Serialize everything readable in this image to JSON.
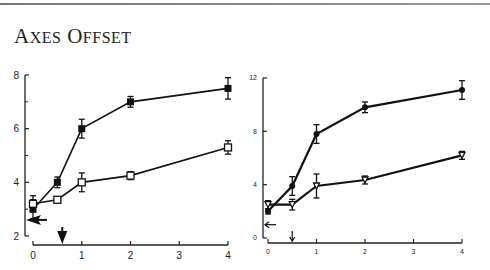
{
  "title": {
    "first_cap": "A",
    "first_rest": "XES",
    "second_cap": "O",
    "second_rest": "FFSET",
    "full": "Axes Offset"
  },
  "chart_data": [
    {
      "type": "line",
      "title": "",
      "xlabel": "",
      "ylabel": "",
      "xlim": [
        0,
        4
      ],
      "ylim": [
        2,
        8
      ],
      "xticks": [
        "0",
        "1",
        "2",
        "3",
        "4"
      ],
      "yticks": [
        "2",
        "4",
        "6",
        "8"
      ],
      "minor_yticks": [
        3,
        5,
        7
      ],
      "grid": false,
      "legend": null,
      "annotations": [
        {
          "type": "arrow-left",
          "at_y": 2.6,
          "note": "arrow pointing left at y-axis"
        },
        {
          "type": "arrow-down",
          "at_x": 0.6,
          "note": "arrow pointing down at x-axis"
        }
      ],
      "x": [
        0,
        0.5,
        1,
        2,
        4
      ],
      "series": [
        {
          "name": "filled squares",
          "marker": "square-filled",
          "values": [
            3.0,
            4.0,
            6.0,
            7.0,
            7.5
          ],
          "errors": [
            0.35,
            0.2,
            0.35,
            0.2,
            0.4
          ]
        },
        {
          "name": "open squares",
          "marker": "square-open",
          "values": [
            3.2,
            3.35,
            4.0,
            4.25,
            5.3
          ],
          "errors": [
            0.3,
            0.1,
            0.35,
            0.15,
            0.25
          ]
        }
      ]
    },
    {
      "type": "line",
      "title": "",
      "xlabel": "",
      "ylabel": "",
      "xlim": [
        0,
        4
      ],
      "ylim": [
        0,
        12
      ],
      "xticks": [
        "0",
        "1",
        "2",
        "3",
        "4"
      ],
      "yticks": [
        "0",
        "4",
        "8",
        "12"
      ],
      "grid": false,
      "legend": null,
      "annotations": [
        {
          "type": "arrow-left",
          "at_y": 1.0,
          "note": "arrow pointing left at y-axis"
        },
        {
          "type": "arrow-down",
          "at_x": 0.5,
          "note": "small arrow pointing down at x-axis"
        }
      ],
      "x": [
        0,
        0.5,
        1,
        2,
        4
      ],
      "series": [
        {
          "name": "filled circles",
          "marker": "circle-filled",
          "values": [
            2.0,
            3.9,
            7.8,
            9.8,
            11.1
          ],
          "errors": [
            0.2,
            0.7,
            0.7,
            0.4,
            0.7
          ]
        },
        {
          "name": "open triangles",
          "marker": "triangle-open",
          "values": [
            2.5,
            2.5,
            3.9,
            4.35,
            6.2
          ],
          "errors": [
            0.3,
            0.4,
            0.9,
            0.3,
            0.3
          ]
        }
      ]
    }
  ]
}
